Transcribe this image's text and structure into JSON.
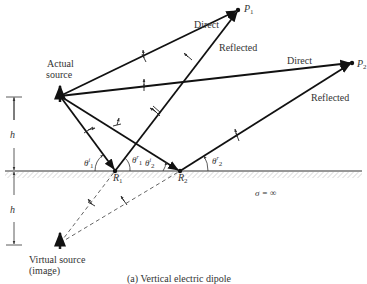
{
  "figure": {
    "caption": "(a)  Vertical electric dipole",
    "actual_source_label": [
      "Actual",
      "source"
    ],
    "virtual_source_label": [
      "Virtual source",
      "(image)"
    ],
    "points": {
      "p1": "P",
      "p1_sub": "1",
      "p2": "P",
      "p2_sub": "2",
      "r1": "R",
      "r1_sub": "1",
      "r2": "R",
      "r2_sub": "2"
    },
    "ray_labels": {
      "direct_1": "Direct",
      "reflected_1": "Reflected",
      "direct_2": "Direct",
      "reflected_2": "Reflected"
    },
    "angles": {
      "theta_i1": "θ",
      "theta_i1_sup": "i",
      "theta_i1_sub": "1",
      "theta_r1": "θ",
      "theta_r1_sup": "r",
      "theta_r1_sub": "1",
      "theta_i2": "θ",
      "theta_i2_sup": "i",
      "theta_i2_sub": "2",
      "theta_r2": "θ",
      "theta_r2_sup": "r",
      "theta_r2_sub": "2"
    },
    "height_label_top": "h",
    "height_label_bottom": "h",
    "conductivity": "σ = ∞"
  }
}
